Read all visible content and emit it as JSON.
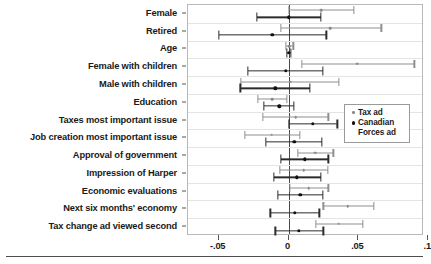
{
  "chart_data": {
    "type": "scatter",
    "title": "",
    "subtitle": "",
    "xlabel": "",
    "ylabel": "",
    "xlim": [
      -0.072,
      0.097
    ],
    "xticks": [
      -0.05,
      0,
      0.05,
      0.1
    ],
    "xtick_labels": [
      "-.05",
      "0",
      ".05",
      ".1"
    ],
    "grid": true,
    "grid_axis": "y",
    "zero_reference_line": 0,
    "legend_position": "right-middle",
    "orientation": "horizontal-ci-dotplot",
    "categories": [
      "Female",
      "Retired",
      "Age",
      "Female with children",
      "Male with children",
      "Education",
      "Taxes most important issue",
      "Job creation most important issue",
      "Approval of government",
      "Impression of Harper",
      "Economic evaluations",
      "Next six months' economy",
      "Tax change ad viewed second"
    ],
    "series": [
      {
        "name": "Tax ad",
        "color": "#8a8a8a",
        "estimates": [
          0.0235,
          0.03,
          0.0005,
          0.049,
          0.001,
          -0.0115,
          0.005,
          -0.012,
          0.019,
          0.011,
          0.0145,
          0.0425,
          0.036
        ],
        "ci_low": [
          0.0,
          -0.0055,
          -0.002,
          0.0095,
          -0.034,
          -0.022,
          -0.0185,
          -0.0315,
          0.0065,
          -0.006,
          0.001,
          0.025,
          0.0195
        ],
        "ci_high": [
          0.047,
          0.0665,
          0.0035,
          0.09,
          0.036,
          -0.001,
          0.0285,
          0.008,
          0.032,
          0.028,
          0.0285,
          0.061,
          0.053
        ]
      },
      {
        "name": "Canadian Forces ad",
        "color": "#111111",
        "estimates": [
          0.0,
          -0.0115,
          0.0003,
          -0.002,
          -0.0095,
          -0.0065,
          0.0175,
          0.004,
          0.0115,
          0.006,
          0.0085,
          0.0045,
          0.0075
        ],
        "ci_low": [
          -0.0225,
          -0.05,
          -0.0012,
          -0.029,
          -0.0345,
          -0.0175,
          0.0,
          -0.0165,
          -0.0055,
          -0.0105,
          -0.0075,
          -0.013,
          -0.0095
        ],
        "ci_high": [
          0.023,
          0.027,
          0.0018,
          0.0245,
          0.0155,
          0.004,
          0.035,
          0.024,
          0.0285,
          0.023,
          0.0245,
          0.022,
          0.025
        ]
      }
    ],
    "legend": [
      {
        "label": "Tax ad",
        "marker": "dot",
        "color": "#8a8a8a"
      },
      {
        "label": "Canadian Forces ad",
        "marker": "dot",
        "color": "#111111"
      }
    ]
  }
}
